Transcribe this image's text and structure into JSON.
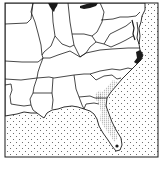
{
  "map": {
    "type": "range-distribution-map",
    "region": "southeastern United States",
    "style": "black-and-white line map",
    "colors": {
      "background": "#ffffff",
      "border_line": "#1a1a1a",
      "ocean_dots": "#555555",
      "range_stipple": "#777777",
      "range_dark": "#1a1a1a"
    },
    "features": [
      {
        "name": "ocean",
        "fill": "dotted"
      },
      {
        "name": "lake-michigan",
        "fill": "solid-black"
      },
      {
        "name": "lake-erie",
        "fill": "solid-black"
      },
      {
        "name": "north-carolina-coast-range",
        "fill": "dark"
      },
      {
        "name": "southeast-coastal-range",
        "fill": "stippled"
      },
      {
        "name": "lake-okeechobee",
        "fill": "solid-black"
      }
    ]
  }
}
